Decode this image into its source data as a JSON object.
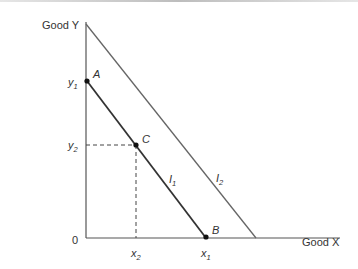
{
  "axes": {
    "y_label": "Good Y",
    "x_label": "Good X",
    "origin": "0"
  },
  "ticks": {
    "y1": {
      "base": "y",
      "sub": "1"
    },
    "y2": {
      "base": "y",
      "sub": "2"
    },
    "x1": {
      "base": "x",
      "sub": "1"
    },
    "x2": {
      "base": "x",
      "sub": "2"
    }
  },
  "points": {
    "A": "A",
    "B": "B",
    "C": "C"
  },
  "curves": {
    "I1": {
      "base": "I",
      "sub": "1"
    },
    "I2": {
      "base": "I",
      "sub": "2"
    }
  },
  "colors": {
    "axis": "#555555",
    "I1": "#333333",
    "I2": "#666666",
    "dashed": "#444444"
  }
}
